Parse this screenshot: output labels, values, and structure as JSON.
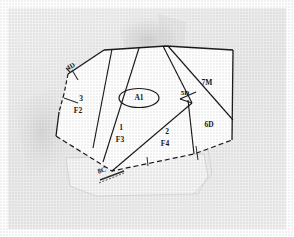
{
  "document": {
    "type": "scanned-parcel-map",
    "caption": "",
    "background_color": "#efefef",
    "paper_color": "#ffffff",
    "ink_color": "#121212",
    "margin_color": "#ffffff"
  },
  "map": {
    "title": "",
    "outline_style": "solid-and-dashed",
    "parcels": [
      {
        "id": "p-4d",
        "number": "4D",
        "code": "",
        "label_x": 63,
        "label_y": 59
      },
      {
        "id": "p-3f2",
        "number": "3",
        "code": "F2",
        "label_x": 73,
        "label_y": 91
      },
      {
        "id": "p-a1",
        "number": "A1",
        "code": "",
        "label_x": 131,
        "label_y": 90
      },
      {
        "id": "p-1f3",
        "number": "1",
        "code": "F3",
        "label_x": 113,
        "label_y": 120
      },
      {
        "id": "p-2f4",
        "number": "2",
        "code": "F4",
        "label_x": 159,
        "label_y": 124
      },
      {
        "id": "p-5d",
        "number": "5D",
        "code": "",
        "label_x": 175,
        "label_y": 85
      },
      {
        "id": "p-7m",
        "number": "7M",
        "code": "",
        "label_x": 199,
        "label_y": 75
      },
      {
        "id": "p-6d",
        "number": "6D",
        "code": "",
        "label_x": 201,
        "label_y": 117
      },
      {
        "id": "p-8c",
        "number": "8C",
        "code": "",
        "label_x": 97,
        "label_y": 165
      }
    ],
    "callouts": [
      {
        "id": "callout-a1",
        "text": "A1",
        "shape": "ellipse"
      }
    ],
    "annotations": {
      "hatch_marks": 2,
      "dashed_boundary": true
    }
  }
}
